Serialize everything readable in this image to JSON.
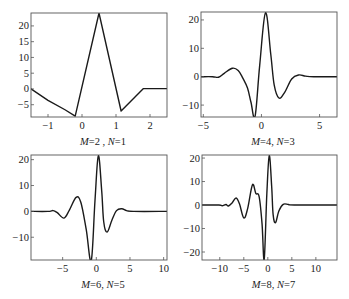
{
  "chart_data": [
    {
      "type": "line",
      "title": "M=2, N=1",
      "caption": {
        "M": "M",
        "Mval": "=2 , ",
        "N": "N",
        "Nval": "=1"
      },
      "xlabel": "",
      "ylabel": "",
      "xlim": [
        -1.5,
        2.5
      ],
      "ylim": [
        -8.9,
        24.1
      ],
      "xticks": [
        -1,
        0,
        1,
        2
      ],
      "yticks": [
        -5,
        0,
        5,
        10,
        15,
        20
      ],
      "frame": {
        "left": 31,
        "top": 13,
        "right": 167,
        "bottom": 117
      },
      "grid": false,
      "smooth": false,
      "points": [
        [
          -1.5,
          0
        ],
        [
          -1.0,
          -3.6
        ],
        [
          -0.5,
          -6.6
        ],
        [
          -0.2,
          -8.6
        ],
        [
          0.5,
          24.1
        ],
        [
          1.15,
          -7.0
        ],
        [
          1.8,
          0.1
        ],
        [
          2.5,
          0.1
        ]
      ]
    },
    {
      "type": "line",
      "title": "M=4, N=3",
      "caption": {
        "M": "M",
        "Mval": "=4, ",
        "N": "N",
        "Nval": "=3"
      },
      "xlabel": "",
      "ylabel": "",
      "xlim": [
        -5.2,
        6.5
      ],
      "ylim": [
        -14.2,
        22.8
      ],
      "xticks": [
        -5,
        0,
        5
      ],
      "yticks": [
        -10,
        0,
        10,
        20
      ],
      "frame": {
        "left": 201,
        "top": 12,
        "right": 337,
        "bottom": 117
      },
      "grid": false,
      "smooth": true,
      "points": [
        [
          -5.2,
          0
        ],
        [
          -4.2,
          0
        ],
        [
          -3.7,
          -0.2
        ],
        [
          -3.2,
          1.2
        ],
        [
          -2.5,
          3.0
        ],
        [
          -2.0,
          2.2
        ],
        [
          -1.6,
          -0.5
        ],
        [
          -1.2,
          -4.0
        ],
        [
          -0.9,
          -9.0
        ],
        [
          -0.55,
          -14.0
        ],
        [
          -0.15,
          4.0
        ],
        [
          0.35,
          22.5
        ],
        [
          0.8,
          8.0
        ],
        [
          1.1,
          -3.0
        ],
        [
          1.5,
          -7.5
        ],
        [
          2.0,
          -5.5
        ],
        [
          2.6,
          -0.8
        ],
        [
          3.2,
          0.6
        ],
        [
          3.8,
          0.2
        ],
        [
          4.5,
          0
        ],
        [
          6.5,
          0
        ]
      ]
    },
    {
      "type": "line",
      "title": "M=6, N=5",
      "caption": {
        "M": "M",
        "Mval": "=6, ",
        "N": "N",
        "Nval": "=5"
      },
      "xlabel": "",
      "ylabel": "",
      "xlim": [
        -9.7,
        10.5
      ],
      "ylim": [
        -18.8,
        21.8
      ],
      "xticks": [
        -5,
        0,
        5,
        10
      ],
      "yticks": [
        -10,
        0,
        10,
        20
      ],
      "frame": {
        "left": 31,
        "top": 155,
        "right": 167,
        "bottom": 260
      },
      "grid": false,
      "smooth": true,
      "points": [
        [
          -9.7,
          0
        ],
        [
          -7.2,
          0
        ],
        [
          -6.4,
          0.3
        ],
        [
          -5.8,
          -0.5
        ],
        [
          -4.8,
          -2.6
        ],
        [
          -4.0,
          0.5
        ],
        [
          -3.0,
          5.4
        ],
        [
          -2.3,
          3.5
        ],
        [
          -1.5,
          -7.0
        ],
        [
          -0.75,
          -19.0
        ],
        [
          -0.2,
          4.0
        ],
        [
          0.3,
          21.5
        ],
        [
          0.8,
          8.0
        ],
        [
          1.1,
          -4.0
        ],
        [
          1.6,
          -8.0
        ],
        [
          2.3,
          -3.5
        ],
        [
          3.0,
          0.3
        ],
        [
          3.8,
          1.0
        ],
        [
          4.5,
          0.3
        ],
        [
          5.5,
          0
        ],
        [
          10.5,
          0
        ]
      ]
    },
    {
      "type": "line",
      "title": "M=8, N=7",
      "caption": {
        "M": "M",
        "Mval": "=8, ",
        "N": "N",
        "Nval": "=7"
      },
      "xlabel": "",
      "ylabel": "",
      "xlim": [
        -13.7,
        14.4
      ],
      "ylim": [
        -23.4,
        21.3
      ],
      "xticks": [
        -10,
        -5,
        0,
        5,
        10
      ],
      "yticks": [
        -20,
        -10,
        0,
        10,
        20
      ],
      "frame": {
        "left": 202,
        "top": 155,
        "right": 337,
        "bottom": 260
      },
      "grid": false,
      "smooth": true,
      "points": [
        [
          -13.7,
          0
        ],
        [
          -10.2,
          0
        ],
        [
          -9.5,
          -0.3
        ],
        [
          -8.7,
          0.2
        ],
        [
          -8.2,
          -0.4
        ],
        [
          -7.4,
          1.0
        ],
        [
          -6.6,
          3.0
        ],
        [
          -5.9,
          0.5
        ],
        [
          -5.0,
          -5.5
        ],
        [
          -4.2,
          -1.5
        ],
        [
          -3.2,
          8.6
        ],
        [
          -2.5,
          5.0
        ],
        [
          -1.8,
          3.5
        ],
        [
          -1.2,
          -8.0
        ],
        [
          -0.75,
          -23.0
        ],
        [
          -0.2,
          5.0
        ],
        [
          0.3,
          21.0
        ],
        [
          0.8,
          8.0
        ],
        [
          1.1,
          -4.0
        ],
        [
          1.6,
          -7.5
        ],
        [
          2.3,
          -2.5
        ],
        [
          3.2,
          0.3
        ],
        [
          4.3,
          0.2
        ],
        [
          5.5,
          0
        ],
        [
          14.4,
          0
        ]
      ]
    }
  ]
}
